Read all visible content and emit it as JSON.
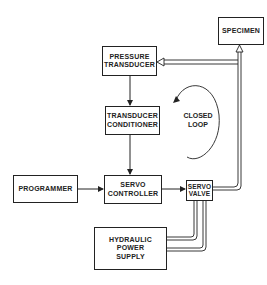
{
  "diagram": {
    "nodes": {
      "specimen": {
        "label": "SPECIMEN"
      },
      "pressure_transducer": {
        "line1": "PRESSURE",
        "line2": "TRANSDUCER"
      },
      "transducer_conditioner": {
        "line1": "TRANSDUCER",
        "line2": "CONDITIONER"
      },
      "programmer": {
        "label": "PROGRAMMER"
      },
      "servo_controller": {
        "line1": "SERVO",
        "line2": "CONTROLLER"
      },
      "servo_valve": {
        "line1": "SERVO",
        "line2": "VALVE"
      },
      "hydraulic_power_supply": {
        "line1": "HYDRAULIC",
        "line2": "POWER",
        "line3": "SUPPLY"
      }
    },
    "loop_label": {
      "line1": "CLOSED",
      "line2": "LOOP"
    },
    "edges": [
      {
        "from": "programmer",
        "to": "servo_controller"
      },
      {
        "from": "servo_controller",
        "to": "servo_valve"
      },
      {
        "from": "servo_valve",
        "to": "specimen"
      },
      {
        "from": "specimen",
        "to": "pressure_transducer"
      },
      {
        "from": "pressure_transducer",
        "to": "transducer_conditioner"
      },
      {
        "from": "transducer_conditioner",
        "to": "servo_controller"
      },
      {
        "from": "hydraulic_power_supply",
        "to": "servo_valve"
      }
    ]
  }
}
